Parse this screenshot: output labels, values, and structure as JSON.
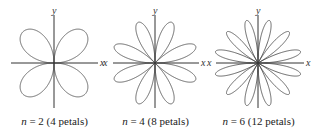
{
  "figure": {
    "stroke_color": "#555555",
    "axis_color": "#333333",
    "panels": [
      {
        "n_label": "n",
        "equals": " = 2 ",
        "petals_text": "(4 petals)",
        "n": 2,
        "petals": 4,
        "x_label": "x",
        "y_label": "y",
        "left_x_label": ""
      },
      {
        "n_label": "n",
        "equals": " = 4 ",
        "petals_text": "(8 petals)",
        "n": 4,
        "petals": 8,
        "x_label": "x",
        "y_label": "y",
        "left_x_label": "x"
      },
      {
        "n_label": "n",
        "equals": " = 6 ",
        "petals_text": "(12 petals)",
        "n": 6,
        "petals": 12,
        "x_label": "x",
        "y_label": "y",
        "left_x_label": "x"
      }
    ]
  }
}
